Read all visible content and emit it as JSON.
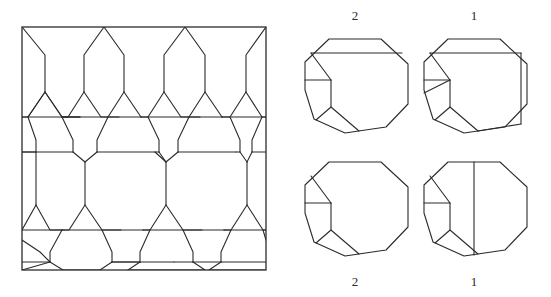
{
  "figure": {
    "background_color": "#ffffff",
    "line_color": "#2b2b2b"
  },
  "tiling_panel": {
    "name": "square-tiling-patch",
    "frame": {
      "x": 22,
      "y": 27,
      "width": 244,
      "height": 243
    }
  },
  "polygon_panels": [
    {
      "id": "panel-top-left",
      "label": "2",
      "label_position": "top",
      "center": {
        "x": 355,
        "y": 88
      },
      "radius": 55
    },
    {
      "id": "panel-top-right",
      "label": "1",
      "label_position": "top",
      "center": {
        "x": 474,
        "y": 88
      },
      "radius": 55
    },
    {
      "id": "panel-bottom-left",
      "label": "2",
      "label_position": "bottom",
      "center": {
        "x": 355,
        "y": 211
      },
      "radius": 55
    },
    {
      "id": "panel-bottom-right",
      "label": "1",
      "label_position": "bottom",
      "center": {
        "x": 474,
        "y": 211
      },
      "radius": 55
    }
  ],
  "labels": {
    "top_left": "2",
    "top_right": "1",
    "bottom_left": "2",
    "bottom_right": "1"
  }
}
